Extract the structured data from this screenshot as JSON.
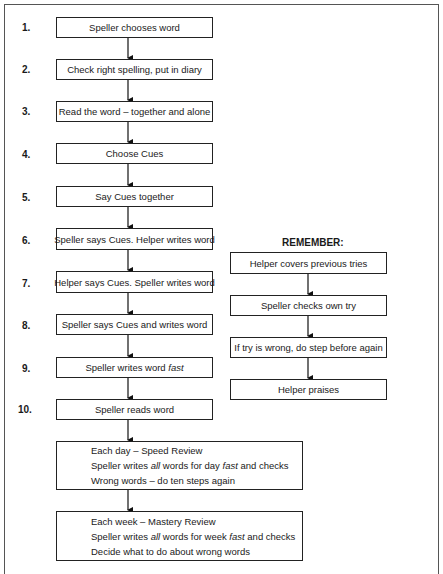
{
  "steps": [
    {
      "num": "1.",
      "text": "Speller chooses word"
    },
    {
      "num": "2.",
      "text": "Check right spelling, put in diary"
    },
    {
      "num": "3.",
      "text": "Read the word – together and alone"
    },
    {
      "num": "4.",
      "text": "Choose Cues"
    },
    {
      "num": "5.",
      "text": "Say Cues together"
    },
    {
      "num": "6.",
      "text": "Speller says Cues. Helper writes word"
    },
    {
      "num": "7.",
      "text": "Helper says Cues. Speller writes word"
    },
    {
      "num": "8.",
      "text": "Speller says Cues and writes word"
    },
    {
      "num": "9.",
      "text_before": "Speller writes word ",
      "text_em": "fast"
    },
    {
      "num": "10.",
      "text": "Speller reads word"
    }
  ],
  "remember": {
    "title": "REMEMBER:",
    "items": [
      "Helper covers previous tries",
      "Speller checks own try",
      "If try is wrong, do step before again",
      "Helper praises"
    ]
  },
  "daily_review": {
    "line1": "Each day – Speed Review",
    "line2_a": "Speller writes ",
    "line2_em1": "all",
    "line2_b": " words for day ",
    "line2_em2": "fast",
    "line2_c": " and checks",
    "line3": "Wrong words – do ten steps again"
  },
  "weekly_review": {
    "line1": "Each week – Mastery Review",
    "line2_a": "Speller writes ",
    "line2_em1": "all",
    "line2_b": " words for week ",
    "line2_em2": "fast",
    "line2_c": " and checks",
    "line3": "Decide what to do about wrong words"
  }
}
